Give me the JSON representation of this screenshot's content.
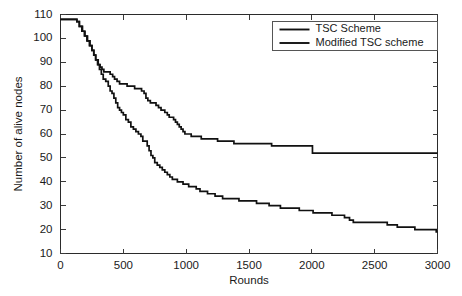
{
  "chart_data": {
    "type": "line",
    "title": "",
    "xlabel": "Rounds",
    "ylabel": "Number of alive nodes",
    "xlim": [
      0,
      3000
    ],
    "ylim": [
      10,
      110
    ],
    "xticks": [
      0,
      500,
      1000,
      1500,
      2000,
      2500,
      3000
    ],
    "yticks": [
      10,
      20,
      30,
      40,
      50,
      60,
      70,
      80,
      90,
      100,
      110
    ],
    "grid": false,
    "legend_position": "top-right",
    "legend": [
      "TSC Scheme",
      "Modified TSC scheme"
    ],
    "series": [
      {
        "name": "TSC Scheme",
        "color": "#111111",
        "points": [
          [
            0,
            108
          ],
          [
            110,
            108
          ],
          [
            130,
            107
          ],
          [
            150,
            105
          ],
          [
            175,
            103
          ],
          [
            195,
            101
          ],
          [
            215,
            99
          ],
          [
            235,
            97
          ],
          [
            250,
            95
          ],
          [
            265,
            93
          ],
          [
            280,
            91
          ],
          [
            300,
            89
          ],
          [
            315,
            88
          ],
          [
            330,
            87
          ],
          [
            345,
            86
          ],
          [
            370,
            86
          ],
          [
            395,
            85
          ],
          [
            415,
            84
          ],
          [
            430,
            83
          ],
          [
            450,
            82
          ],
          [
            470,
            81
          ],
          [
            500,
            81
          ],
          [
            530,
            80
          ],
          [
            560,
            80
          ],
          [
            590,
            79
          ],
          [
            620,
            79
          ],
          [
            645,
            78
          ],
          [
            665,
            77
          ],
          [
            680,
            75
          ],
          [
            695,
            74
          ],
          [
            715,
            73
          ],
          [
            740,
            73
          ],
          [
            760,
            72
          ],
          [
            780,
            71
          ],
          [
            800,
            70
          ],
          [
            815,
            70
          ],
          [
            830,
            69
          ],
          [
            850,
            68
          ],
          [
            865,
            67
          ],
          [
            880,
            67
          ],
          [
            900,
            66
          ],
          [
            915,
            65
          ],
          [
            930,
            64
          ],
          [
            945,
            63
          ],
          [
            960,
            62
          ],
          [
            975,
            61
          ],
          [
            990,
            60
          ],
          [
            1010,
            60
          ],
          [
            1040,
            59
          ],
          [
            1080,
            59
          ],
          [
            1120,
            58
          ],
          [
            1180,
            58
          ],
          [
            1250,
            57
          ],
          [
            1330,
            57
          ],
          [
            1380,
            56
          ],
          [
            1500,
            56
          ],
          [
            1620,
            56
          ],
          [
            1680,
            55
          ],
          [
            1800,
            55
          ],
          [
            1900,
            55
          ],
          [
            1990,
            55
          ],
          [
            2005,
            52
          ],
          [
            2200,
            52
          ],
          [
            2500,
            52
          ],
          [
            2800,
            52
          ],
          [
            3000,
            52
          ]
        ]
      },
      {
        "name": "Modified TSC scheme",
        "color": "#111111",
        "points": [
          [
            0,
            108
          ],
          [
            110,
            108
          ],
          [
            130,
            107
          ],
          [
            150,
            105
          ],
          [
            170,
            103
          ],
          [
            190,
            101
          ],
          [
            210,
            99
          ],
          [
            230,
            97
          ],
          [
            250,
            95
          ],
          [
            265,
            93
          ],
          [
            280,
            91
          ],
          [
            295,
            89
          ],
          [
            310,
            87
          ],
          [
            325,
            85
          ],
          [
            340,
            83
          ],
          [
            360,
            82
          ],
          [
            380,
            80
          ],
          [
            395,
            78
          ],
          [
            410,
            77
          ],
          [
            425,
            75
          ],
          [
            440,
            73
          ],
          [
            455,
            71
          ],
          [
            470,
            70
          ],
          [
            485,
            69
          ],
          [
            500,
            68
          ],
          [
            520,
            66
          ],
          [
            540,
            65
          ],
          [
            560,
            63
          ],
          [
            580,
            62
          ],
          [
            600,
            61
          ],
          [
            620,
            60
          ],
          [
            640,
            59
          ],
          [
            655,
            57
          ],
          [
            675,
            57
          ],
          [
            690,
            55
          ],
          [
            705,
            53
          ],
          [
            720,
            51
          ],
          [
            735,
            50
          ],
          [
            750,
            48
          ],
          [
            770,
            47
          ],
          [
            790,
            46
          ],
          [
            810,
            45
          ],
          [
            830,
            44
          ],
          [
            850,
            43
          ],
          [
            870,
            42
          ],
          [
            890,
            41
          ],
          [
            910,
            41
          ],
          [
            930,
            40
          ],
          [
            950,
            40
          ],
          [
            975,
            39
          ],
          [
            1000,
            39
          ],
          [
            1020,
            38
          ],
          [
            1050,
            38
          ],
          [
            1080,
            37
          ],
          [
            1110,
            36
          ],
          [
            1140,
            36
          ],
          [
            1170,
            35
          ],
          [
            1200,
            35
          ],
          [
            1230,
            34
          ],
          [
            1260,
            34
          ],
          [
            1290,
            33
          ],
          [
            1330,
            33
          ],
          [
            1380,
            33
          ],
          [
            1420,
            32
          ],
          [
            1470,
            32
          ],
          [
            1520,
            32
          ],
          [
            1560,
            31
          ],
          [
            1610,
            31
          ],
          [
            1660,
            30
          ],
          [
            1700,
            30
          ],
          [
            1750,
            29
          ],
          [
            1800,
            29
          ],
          [
            1850,
            29
          ],
          [
            1900,
            28
          ],
          [
            1960,
            28
          ],
          [
            2010,
            27
          ],
          [
            2060,
            27
          ],
          [
            2110,
            27
          ],
          [
            2160,
            26
          ],
          [
            2210,
            26
          ],
          [
            2260,
            25
          ],
          [
            2300,
            24
          ],
          [
            2330,
            23
          ],
          [
            2400,
            23
          ],
          [
            2480,
            23
          ],
          [
            2550,
            23
          ],
          [
            2600,
            22
          ],
          [
            2650,
            22
          ],
          [
            2680,
            21
          ],
          [
            2720,
            21
          ],
          [
            2780,
            21
          ],
          [
            2820,
            20
          ],
          [
            2870,
            20
          ],
          [
            2930,
            20
          ],
          [
            2970,
            20
          ],
          [
            2990,
            19
          ],
          [
            3000,
            19
          ]
        ]
      }
    ]
  },
  "axis": {
    "y_title": "Number of alive nodes",
    "x_title": "Rounds"
  }
}
